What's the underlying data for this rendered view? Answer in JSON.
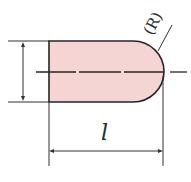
{
  "diagram": {
    "type": "technical-drawing",
    "colors": {
      "fill": "#f5d5d3",
      "stroke": "#2b2224",
      "line": "#333333",
      "background": "#ffffff"
    },
    "labels": {
      "length": "l",
      "radius": "(R)"
    }
  }
}
